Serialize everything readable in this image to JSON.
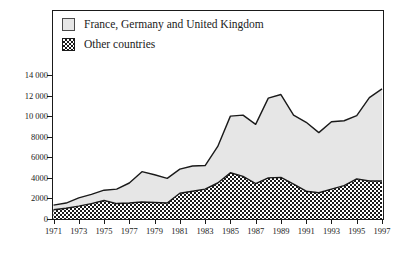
{
  "legend": {
    "items": [
      {
        "label": "France, Germany and United Kingdom",
        "swatch": "light-gray-square",
        "color": "#e6e6e6"
      },
      {
        "label": "Other countries",
        "swatch": "checkerboard-square",
        "color": "#1a1a1a"
      }
    ]
  },
  "axes": {
    "y_ticks": [
      "0",
      "2000",
      "4000",
      "6000",
      "8000",
      "10 000",
      "12 000",
      "14 000"
    ],
    "x_ticks": [
      "1971",
      "1973",
      "1975",
      "1977",
      "1979",
      "1981",
      "1983",
      "1985",
      "1987",
      "1989",
      "1991",
      "1993",
      "1995",
      "1997"
    ]
  },
  "chart_data": {
    "type": "area",
    "stacked": true,
    "title": "",
    "subtitle": "",
    "xlabel": "",
    "ylabel": "",
    "xlim": [
      1971,
      1997
    ],
    "ylim": [
      0,
      15200
    ],
    "grid": false,
    "legend_position": "top-left",
    "x": [
      1971,
      1972,
      1973,
      1974,
      1975,
      1976,
      1977,
      1978,
      1979,
      1980,
      1981,
      1982,
      1983,
      1984,
      1985,
      1986,
      1987,
      1988,
      1989,
      1990,
      1991,
      1992,
      1993,
      1994,
      1995,
      1996,
      1997
    ],
    "series": [
      {
        "name": "Other countries",
        "fill": "checkerboard",
        "values": [
          900,
          1050,
          1250,
          1500,
          1800,
          1500,
          1550,
          1650,
          1600,
          1550,
          2500,
          2700,
          2900,
          3500,
          4500,
          4150,
          3450,
          4000,
          4050,
          3400,
          2700,
          2550,
          2900,
          3250,
          3900,
          3700,
          3700
        ]
      },
      {
        "name": "France, Germany and United Kingdom",
        "fill": "#e6e6e6",
        "values": [
          450,
          500,
          800,
          900,
          1000,
          1400,
          1950,
          2950,
          2700,
          2400,
          2350,
          2450,
          2300,
          3550,
          5500,
          5950,
          5750,
          7750,
          8050,
          6700,
          6700,
          5850,
          6550,
          6300,
          6150,
          8100,
          8950
        ]
      }
    ],
    "totals": [
      1350,
      1550,
      2050,
      2400,
      2800,
      2900,
      3500,
      4600,
      4300,
      3950,
      4850,
      5150,
      5200,
      7050,
      10000,
      10100,
      9200,
      11750,
      12100,
      10100,
      9400,
      8400,
      9450,
      9550,
      10050,
      11800,
      12650
    ]
  }
}
